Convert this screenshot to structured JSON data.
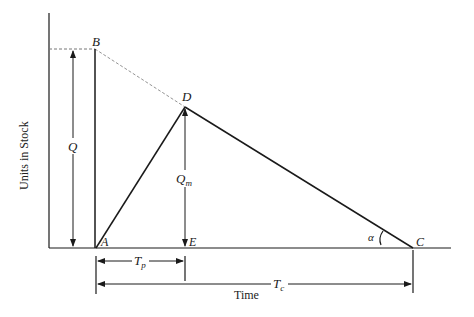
{
  "diagram": {
    "type": "inventory-cycle",
    "axes": {
      "y_label": "Units in Stock",
      "x_label": "Time"
    },
    "points": {
      "A": "A",
      "B": "B",
      "C": "C",
      "D": "D",
      "E": "E"
    },
    "dimensions": {
      "Q": "Q",
      "Qm_main": "Q",
      "Qm_sub": "m",
      "Tp_main": "T",
      "Tp_sub": "p",
      "Tc_main": "T",
      "Tc_sub": "c",
      "angle": "α"
    },
    "colors": {
      "line": "#1a1a1a",
      "dashed": "#777777"
    }
  }
}
